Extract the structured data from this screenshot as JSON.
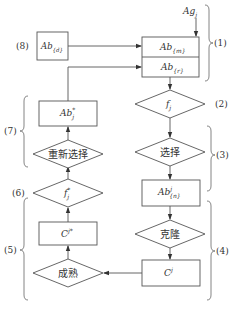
{
  "diagram": {
    "type": "flowchart",
    "title": "",
    "colors": {
      "stroke": "#555555",
      "text": "#333333",
      "background": "#ffffff"
    },
    "nodes": {
      "ag_input": {
        "base": "Ag",
        "sub": "j"
      },
      "memory_ab_d": {
        "base": "Ab",
        "sub": "{d}"
      },
      "ab_m": {
        "base": "Ab",
        "sub": "{m}"
      },
      "ab_r": {
        "base": "Ab",
        "sub": "{r}"
      },
      "affinity_f": {
        "base": "f",
        "sub": "j"
      },
      "select": {
        "label": "选择"
      },
      "ab_n": {
        "base": "Ab",
        "sup": "j",
        "sub": "{n}"
      },
      "clone": {
        "label": "克隆"
      },
      "c_j": {
        "base": "C",
        "sup": "j"
      },
      "mature": {
        "label": "成熟"
      },
      "c_j_star": {
        "base": "C",
        "sup": "j*"
      },
      "affinity_f_star": {
        "base": "f",
        "sup": "*",
        "sub": "j"
      },
      "reselect": {
        "label": "重新选择"
      },
      "ab_j_star": {
        "base": "Ab",
        "sup": "*",
        "sub": "j"
      }
    },
    "step_labels": {
      "s1": "(1)",
      "s2": "(2)",
      "s3": "(3)",
      "s4": "(4)",
      "s5": "(5)",
      "s6": "(6)",
      "s7": "(7)",
      "s8": "(8)"
    },
    "edges": [
      {
        "from": "Ag_j",
        "to": "Ab_{m}"
      },
      {
        "from": "Ab_{d}",
        "to": "Ab_{m}"
      },
      {
        "from": "Ab_{m}/Ab_{r}",
        "to": "f_j"
      },
      {
        "from": "f_j",
        "to": "选择"
      },
      {
        "from": "选择",
        "to": "Ab^j_{n}"
      },
      {
        "from": "Ab^j_{n}",
        "to": "克隆"
      },
      {
        "from": "克隆",
        "to": "C^j"
      },
      {
        "from": "C^j",
        "to": "成熟"
      },
      {
        "from": "成熟",
        "to": "C^j*"
      },
      {
        "from": "C^j*",
        "to": "f*_j"
      },
      {
        "from": "f*_j",
        "to": "重新选择"
      },
      {
        "from": "重新选择",
        "to": "Ab*_j"
      },
      {
        "from": "Ab*_j",
        "to": "Ab_{r}"
      }
    ]
  }
}
